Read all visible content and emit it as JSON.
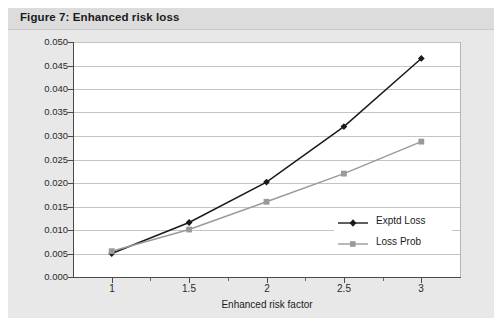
{
  "figure": {
    "title": "Figure 7: Enhanced risk loss",
    "background_color": "#e8e8e8",
    "title_bar_color": "#dcdcdc",
    "plot_background": "#ffffff"
  },
  "chart_data": {
    "type": "line",
    "title": "Figure 7: Enhanced risk loss",
    "xlabel": "Enhanced risk factor",
    "ylabel": "",
    "x": [
      1,
      1.5,
      2,
      2.5,
      3
    ],
    "xtick_labels": [
      "1",
      "1.5",
      "2",
      "2.5",
      "3"
    ],
    "xlim": [
      0.75,
      3.25
    ],
    "ylim": [
      0.0,
      0.05
    ],
    "ytick_labels": [
      "0.000",
      "0.005",
      "0.010",
      "0.015",
      "0.020",
      "0.025",
      "0.030",
      "0.035",
      "0.040",
      "0.045",
      "0.050"
    ],
    "ytick_values": [
      0.0,
      0.005,
      0.01,
      0.015,
      0.02,
      0.025,
      0.03,
      0.035,
      0.04,
      0.045,
      0.05
    ],
    "grid": "horizontal",
    "legend_position": "center-right-inside",
    "series": [
      {
        "name": "Exptd Loss",
        "values": [
          0.005,
          0.0116,
          0.0202,
          0.032,
          0.0465
        ],
        "color": "#1a1a1a",
        "marker": "diamond"
      },
      {
        "name": "Loss Prob",
        "values": [
          0.0055,
          0.0101,
          0.016,
          0.022,
          0.0288
        ],
        "color": "#9a9a9a",
        "marker": "square"
      }
    ]
  },
  "legend": {
    "items": [
      {
        "label": "Exptd Loss"
      },
      {
        "label": "Loss Prob"
      }
    ]
  }
}
